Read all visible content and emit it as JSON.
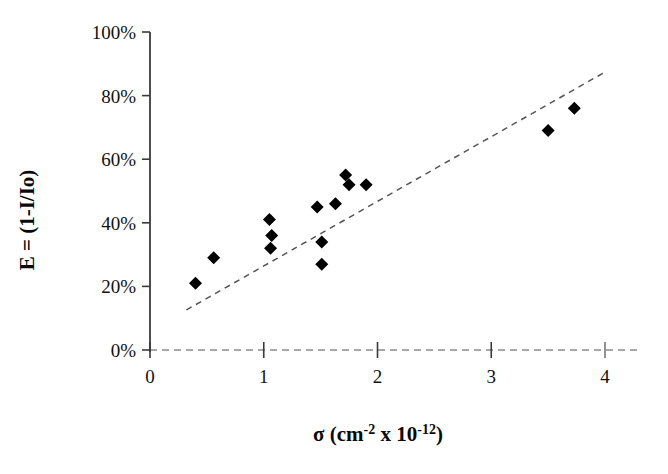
{
  "chart_data": {
    "type": "scatter",
    "title": "",
    "xlabel": "σ (cm⁻² x 10⁻¹²)",
    "ylabel": "E = (1-I/Io)",
    "xlim": [
      0,
      4
    ],
    "ylim": [
      0,
      100
    ],
    "xticks": [
      0,
      1,
      2,
      3,
      4
    ],
    "xticklabels": [
      "0",
      "1",
      "2",
      "3",
      "4"
    ],
    "yticks": [
      0,
      20,
      40,
      60,
      80,
      100
    ],
    "yticklabels": [
      "0%",
      "20%",
      "40%",
      "60%",
      "80%",
      "100%"
    ],
    "grid": false,
    "legend": false,
    "marker": "diamond",
    "marker_color": "#000000",
    "marker_size": 13,
    "points": [
      {
        "x": 0.4,
        "y": 21
      },
      {
        "x": 0.56,
        "y": 29
      },
      {
        "x": 1.05,
        "y": 41
      },
      {
        "x": 1.07,
        "y": 36
      },
      {
        "x": 1.06,
        "y": 32
      },
      {
        "x": 1.47,
        "y": 45
      },
      {
        "x": 1.63,
        "y": 46
      },
      {
        "x": 1.51,
        "y": 34
      },
      {
        "x": 1.51,
        "y": 27
      },
      {
        "x": 1.72,
        "y": 55
      },
      {
        "x": 1.75,
        "y": 52
      },
      {
        "x": 1.9,
        "y": 52
      },
      {
        "x": 3.5,
        "y": 69
      },
      {
        "x": 3.73,
        "y": 76
      }
    ],
    "trendline": {
      "style": "dashed",
      "color": "#555555",
      "x_start": 0.32,
      "y_start": 12.6,
      "x_end": 4.0,
      "y_end": 87.4
    },
    "xaxis_parts": {
      "sigma": "σ",
      "open": " (cm",
      "exp1": "-2",
      "times": " x 10",
      "exp2": "-12",
      "close": ")"
    }
  }
}
